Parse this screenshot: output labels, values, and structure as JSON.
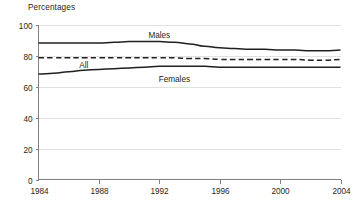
{
  "chart_data": {
    "type": "line",
    "title": "Percentages",
    "xlabel": "",
    "ylabel": "Percentages",
    "xlim": [
      1984,
      2004
    ],
    "ylim": [
      0,
      100
    ],
    "grid": true,
    "legend": "inline-labels",
    "x_ticks": [
      "1984",
      "1988",
      "1992",
      "1996",
      "2000",
      "2004"
    ],
    "y_ticks": [
      "0",
      "20",
      "40",
      "60",
      "80",
      "100"
    ],
    "x": [
      1984,
      1985,
      1986,
      1987,
      1988,
      1989,
      1990,
      1991,
      1992,
      1993,
      1994,
      1995,
      1996,
      1997,
      1998,
      1999,
      2000,
      2001,
      2002,
      2003,
      2004
    ],
    "series": [
      {
        "name": "Males",
        "style": "solid",
        "color": "#231f20",
        "label_x": 1992,
        "label_y": 93,
        "values": [
          88,
          88,
          88,
          88,
          88,
          88.5,
          89,
          89,
          89,
          88.5,
          87.5,
          86,
          85,
          84.5,
          84,
          84,
          83.5,
          83.5,
          83,
          83,
          83.5
        ]
      },
      {
        "name": "All",
        "style": "dashed",
        "color": "#231f20",
        "label_x": 1987,
        "label_y": 74,
        "values": [
          78.5,
          78.5,
          78.5,
          78.5,
          78.5,
          78.5,
          78.5,
          78.5,
          78.5,
          78.5,
          78,
          78,
          77.5,
          77.5,
          77.5,
          77.5,
          77.5,
          77.5,
          77,
          77,
          77.5
        ]
      },
      {
        "name": "Females",
        "style": "solid",
        "color": "#231f20",
        "label_x": 1993,
        "label_y": 65,
        "values": [
          68,
          68.5,
          69.5,
          70.5,
          71,
          71.5,
          72,
          72.5,
          73,
          73,
          73,
          73,
          72.5,
          72.5,
          72.5,
          72.5,
          72.5,
          72.5,
          72.5,
          72.5,
          72.5
        ]
      }
    ]
  }
}
